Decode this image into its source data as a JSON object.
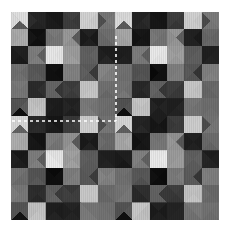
{
  "figure": {
    "type": "image",
    "background_color": "#ffffff",
    "canvas_width": 230,
    "canvas_height": 244
  },
  "mosaic": {
    "origin_x": 11,
    "origin_y": 12,
    "cell_size": 17.35,
    "cols": 12,
    "rows": 12,
    "palette": {
      "white": "#f0f0ee",
      "near_white": "#e2e2e0",
      "light": "#c9c9c6",
      "light_mid": "#aeaeab",
      "mid": "#8f8f8d",
      "mid_dark": "#6f6f6e",
      "dark": "#4e4e4e",
      "darker": "#353535",
      "very_dark": "#232323",
      "black": "#111111"
    },
    "note": "Each cell is a square split into four diagonal triangles (top, right, bottom, left) with independent gray values."
  },
  "chart_data": {
    "type": "heatmap",
    "title": "",
    "xlabel": "",
    "ylabel": "",
    "grid": false,
    "legend": "none",
    "cols": 12,
    "rows": 12,
    "value_range": [
      0,
      255
    ],
    "cells": [
      [
        [
          225,
          225,
          95,
          225
        ],
        [
          40,
          40,
          40,
          40
        ],
        [
          26,
          26,
          26,
          26
        ],
        [
          60,
          60,
          60,
          60
        ],
        [
          205,
          205,
          205,
          205
        ],
        [
          120,
          120,
          120,
          78
        ],
        [
          215,
          215,
          95,
          215
        ],
        [
          38,
          38,
          38,
          38
        ],
        [
          26,
          26,
          26,
          26
        ],
        [
          58,
          58,
          58,
          58
        ],
        [
          205,
          205,
          205,
          205
        ],
        [
          118,
          118,
          118,
          76
        ]
      ],
      [
        [
          170,
          170,
          170,
          170
        ],
        [
          20,
          20,
          20,
          20
        ],
        [
          120,
          120,
          120,
          120
        ],
        [
          150,
          95,
          150,
          150
        ],
        [
          30,
          30,
          30,
          30
        ],
        [
          108,
          108,
          108,
          108
        ],
        [
          168,
          168,
          168,
          168
        ],
        [
          20,
          20,
          20,
          20
        ],
        [
          118,
          118,
          118,
          118
        ],
        [
          148,
          92,
          148,
          148
        ],
        [
          30,
          30,
          30,
          30
        ],
        [
          106,
          106,
          106,
          106
        ]
      ],
      [
        [
          28,
          28,
          28,
          28
        ],
        [
          128,
          98,
          128,
          128
        ],
        [
          232,
          232,
          232,
          232
        ],
        [
          160,
          160,
          160,
          160
        ],
        [
          96,
          96,
          96,
          96
        ],
        [
          34,
          34,
          34,
          34
        ],
        [
          28,
          28,
          28,
          28
        ],
        [
          126,
          96,
          126,
          126
        ],
        [
          232,
          232,
          232,
          232
        ],
        [
          158,
          158,
          158,
          158
        ],
        [
          96,
          96,
          96,
          96
        ],
        [
          34,
          34,
          34,
          34
        ]
      ],
      [
        [
          112,
          112,
          112,
          112
        ],
        [
          88,
          88,
          88,
          88
        ],
        [
          14,
          14,
          14,
          14
        ],
        [
          128,
          128,
          128,
          128
        ],
        [
          92,
          56,
          92,
          92
        ],
        [
          130,
          130,
          130,
          130
        ],
        [
          110,
          110,
          110,
          110
        ],
        [
          86,
          86,
          86,
          86
        ],
        [
          14,
          14,
          14,
          14
        ],
        [
          126,
          126,
          126,
          126
        ],
        [
          90,
          54,
          90,
          90
        ],
        [
          128,
          128,
          128,
          128
        ]
      ],
      [
        [
          120,
          120,
          120,
          120
        ],
        [
          44,
          44,
          44,
          44
        ],
        [
          96,
          58,
          96,
          96
        ],
        [
          62,
          62,
          62,
          62
        ],
        [
          196,
          196,
          196,
          196
        ],
        [
          108,
          108,
          108,
          108
        ],
        [
          118,
          118,
          118,
          118
        ],
        [
          44,
          44,
          44,
          44
        ],
        [
          96,
          56,
          96,
          96
        ],
        [
          60,
          60,
          60,
          60
        ],
        [
          196,
          196,
          196,
          196
        ],
        [
          106,
          106,
          106,
          106
        ]
      ],
      [
        [
          88,
          88,
          20,
          88
        ],
        [
          196,
          196,
          196,
          196
        ],
        [
          32,
          32,
          32,
          32
        ],
        [
          36,
          36,
          36,
          36
        ],
        [
          120,
          120,
          120,
          120
        ],
        [
          112,
          112,
          112,
          112
        ],
        [
          86,
          86,
          20,
          86
        ],
        [
          196,
          196,
          196,
          196
        ],
        [
          32,
          32,
          32,
          32
        ],
        [
          36,
          36,
          36,
          36
        ],
        [
          118,
          118,
          118,
          118
        ],
        [
          110,
          110,
          110,
          110
        ]
      ],
      [
        [
          215,
          215,
          95,
          215
        ],
        [
          40,
          40,
          40,
          40
        ],
        [
          26,
          26,
          26,
          26
        ],
        [
          60,
          60,
          60,
          60
        ],
        [
          205,
          205,
          205,
          205
        ],
        [
          120,
          120,
          120,
          78
        ],
        [
          215,
          215,
          95,
          215
        ],
        [
          38,
          38,
          38,
          38
        ],
        [
          26,
          26,
          26,
          26
        ],
        [
          58,
          58,
          58,
          58
        ],
        [
          205,
          205,
          205,
          205
        ],
        [
          118,
          118,
          118,
          76
        ]
      ],
      [
        [
          170,
          170,
          170,
          170
        ],
        [
          20,
          20,
          20,
          20
        ],
        [
          120,
          120,
          120,
          120
        ],
        [
          150,
          95,
          150,
          150
        ],
        [
          30,
          30,
          30,
          30
        ],
        [
          108,
          108,
          108,
          108
        ],
        [
          168,
          168,
          168,
          168
        ],
        [
          20,
          20,
          20,
          20
        ],
        [
          118,
          118,
          118,
          118
        ],
        [
          148,
          92,
          148,
          148
        ],
        [
          30,
          30,
          30,
          30
        ],
        [
          106,
          106,
          106,
          106
        ]
      ],
      [
        [
          28,
          28,
          28,
          28
        ],
        [
          128,
          98,
          128,
          128
        ],
        [
          232,
          232,
          232,
          232
        ],
        [
          160,
          160,
          160,
          160
        ],
        [
          96,
          96,
          96,
          96
        ],
        [
          34,
          34,
          34,
          34
        ],
        [
          28,
          28,
          28,
          28
        ],
        [
          126,
          96,
          126,
          126
        ],
        [
          232,
          232,
          232,
          232
        ],
        [
          158,
          158,
          158,
          158
        ],
        [
          96,
          96,
          96,
          96
        ],
        [
          34,
          34,
          34,
          34
        ]
      ],
      [
        [
          112,
          112,
          112,
          112
        ],
        [
          88,
          88,
          88,
          88
        ],
        [
          14,
          14,
          14,
          14
        ],
        [
          128,
          128,
          128,
          128
        ],
        [
          92,
          56,
          92,
          92
        ],
        [
          130,
          130,
          130,
          130
        ],
        [
          110,
          110,
          110,
          110
        ],
        [
          86,
          86,
          86,
          86
        ],
        [
          14,
          14,
          14,
          14
        ],
        [
          126,
          126,
          126,
          126
        ],
        [
          90,
          54,
          90,
          90
        ],
        [
          128,
          128,
          128,
          128
        ]
      ],
      [
        [
          120,
          120,
          120,
          120
        ],
        [
          44,
          44,
          44,
          44
        ],
        [
          96,
          58,
          96,
          96
        ],
        [
          62,
          62,
          62,
          62
        ],
        [
          196,
          196,
          196,
          196
        ],
        [
          108,
          108,
          108,
          108
        ],
        [
          118,
          118,
          118,
          118
        ],
        [
          44,
          44,
          44,
          44
        ],
        [
          96,
          56,
          96,
          96
        ],
        [
          60,
          60,
          60,
          60
        ],
        [
          196,
          196,
          196,
          196
        ],
        [
          106,
          106,
          106,
          106
        ]
      ],
      [
        [
          88,
          88,
          20,
          88
        ],
        [
          196,
          196,
          196,
          196
        ],
        [
          32,
          32,
          32,
          32
        ],
        [
          36,
          36,
          36,
          36
        ],
        [
          120,
          120,
          120,
          120
        ],
        [
          112,
          112,
          112,
          112
        ],
        [
          86,
          86,
          20,
          86
        ],
        [
          196,
          196,
          196,
          196
        ],
        [
          32,
          32,
          32,
          32
        ],
        [
          36,
          36,
          36,
          36
        ],
        [
          118,
          118,
          118,
          118
        ],
        [
          110,
          110,
          110,
          110
        ]
      ]
    ]
  },
  "annotations": {
    "marker_color": "#ffffff",
    "dash_pattern": "3 3",
    "lines": [
      {
        "name": "vertical-dashed-marker",
        "x1": 116,
        "y1": 36,
        "x2": 116,
        "y2": 121,
        "orientation": "vertical"
      },
      {
        "name": "horizontal-dashed-marker",
        "x1": 12,
        "y1": 121,
        "x2": 116,
        "y2": 121,
        "orientation": "horizontal"
      }
    ]
  }
}
